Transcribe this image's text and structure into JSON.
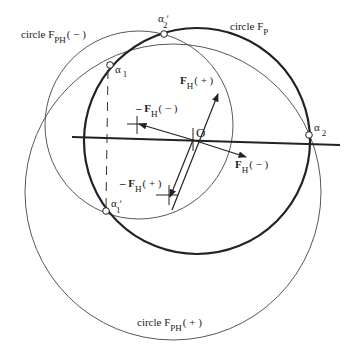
{
  "diagram": {
    "labels": {
      "circle_fph_minus": {
        "main": "circle F",
        "sub": "PH",
        "tail": "( − )"
      },
      "circle_fp": {
        "main": "circle F",
        "sub": "P"
      },
      "circle_fph_plus": {
        "main": "circle F",
        "sub": "PH",
        "tail": "( + )"
      },
      "alpha1": {
        "main": "α",
        "sub": "1"
      },
      "alpha1_prime": {
        "main": "α ʹ",
        "sub": "1"
      },
      "alpha2": {
        "main": "α",
        "sub": "2"
      },
      "alpha2_prime": {
        "main": "α ʹ",
        "sub": "2"
      },
      "origin": "O",
      "fh_plus": {
        "main": "F",
        "sub": "H",
        "tail": "( + )"
      },
      "fh_minus": {
        "main": "F",
        "sub": "H",
        "tail": "( − )"
      },
      "neg_fh_minus": {
        "pre": "– F",
        "sub": "H",
        "tail": "( − )"
      },
      "neg_fh_plus": {
        "pre": "– F",
        "sub": "H",
        "tail": "( + )"
      }
    },
    "colors": {
      "ink": "#222222",
      "thin_ink": "#444444"
    }
  }
}
